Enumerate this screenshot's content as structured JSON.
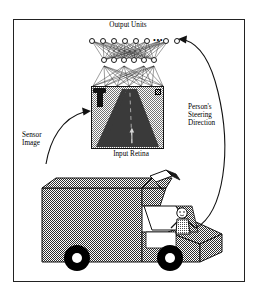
{
  "figure": {
    "title_visible": false,
    "frame_color": "#222222",
    "background_color": "#ffffff"
  },
  "labels": {
    "output_units": "Output Units",
    "input_retina": "Input Retina",
    "sensor_image": "Sensor\nImage",
    "steering_direction": "Person's\nSteering\nDirection"
  },
  "network": {
    "output_layer": {
      "name": "Output Units",
      "visible_nodes_left": 6,
      "visible_nodes_right": 2,
      "ellipsis": "•••",
      "node_count_label": "",
      "y": 40
    },
    "hidden_layer": {
      "name": "Hidden Units",
      "node_count": 6,
      "y": 60
    },
    "input_layer": {
      "name": "Input Retina",
      "type": "image-grid"
    },
    "node_fill": "#ffffff",
    "node_stroke": "#1a1a1a",
    "connection_color": "#1a1a1a"
  },
  "retina_image": {
    "scene": "road ahead from vehicle camera",
    "road_color": "#3a3a3a",
    "grass_color": "#9a9a9a",
    "objects": [
      "road-sign-post",
      "lane-marking",
      "corner-marker"
    ]
  },
  "vehicle": {
    "type": "van",
    "body_color": "#8c8c8c",
    "wheel_color": "#000000",
    "parts": [
      "roof-camera",
      "windshield",
      "driver",
      "hood",
      "front-wheel",
      "rear-wheel"
    ]
  },
  "arrows": {
    "sensor_image": {
      "label": "Sensor\nImage",
      "from": "vehicle-roof-camera",
      "to": "input-retina",
      "direction": "right"
    },
    "steering_direction": {
      "label": "Person's\nSteering\nDirection",
      "from": "driver",
      "to": "output-units",
      "direction": "up-left"
    }
  }
}
